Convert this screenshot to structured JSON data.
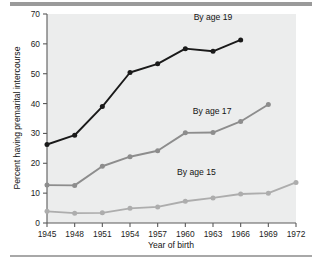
{
  "figure": {
    "background": "#ffffff",
    "plot_background": "#eceded",
    "rule_color": "#9a9a9a"
  },
  "chart_data": {
    "type": "line",
    "title": "",
    "xlabel": "Year of birth",
    "ylabel": "Percent having premarital intercourse",
    "x": [
      1945,
      1948,
      1951,
      1954,
      1957,
      1960,
      1963,
      1966,
      1969,
      1972
    ],
    "xtick_labels": [
      "1945",
      "1948",
      "1951",
      "1954",
      "1957",
      "1960",
      "1963",
      "1966",
      "1969",
      "1972"
    ],
    "ytick_labels": [
      "0",
      "10",
      "20",
      "30",
      "40",
      "50",
      "60",
      "70"
    ],
    "yticks": [
      0,
      10,
      20,
      30,
      40,
      50,
      60,
      70
    ],
    "ylim": [
      0,
      70
    ],
    "xlim": [
      1945,
      1972
    ],
    "grid": false,
    "legend_position": "inline-annotations",
    "series": [
      {
        "name": "By age 19",
        "label": "By age 19",
        "color": "#1a1a1a",
        "marker": "circle",
        "x": [
          1945,
          1948,
          1951,
          1954,
          1957,
          1960,
          1963,
          1966
        ],
        "values": [
          26.3,
          29.4,
          39.0,
          50.4,
          53.3,
          58.4,
          57.5,
          61.3
        ]
      },
      {
        "name": "By age 17",
        "label": "By age 17",
        "color": "#8d8d8d",
        "marker": "circle",
        "x": [
          1945,
          1948,
          1951,
          1954,
          1957,
          1960,
          1963,
          1966,
          1969
        ],
        "values": [
          12.7,
          12.6,
          19.0,
          22.2,
          24.2,
          30.2,
          30.3,
          34.0,
          39.7
        ]
      },
      {
        "name": "By age 15",
        "label": "By age 15",
        "color": "#adadad",
        "marker": "circle",
        "x": [
          1945,
          1948,
          1951,
          1954,
          1957,
          1960,
          1963,
          1966,
          1969,
          1972
        ],
        "values": [
          3.9,
          3.3,
          3.4,
          4.9,
          5.4,
          7.3,
          8.4,
          9.7,
          10.0,
          13.6
        ]
      }
    ],
    "annotations": [
      {
        "text": "By age 19",
        "x": 1963.0,
        "y": 68.0
      },
      {
        "text": "By age 17",
        "x": 1962.9,
        "y": 36.6
      },
      {
        "text": "By age 15",
        "x": 1961.2,
        "y": 16.2
      }
    ]
  }
}
